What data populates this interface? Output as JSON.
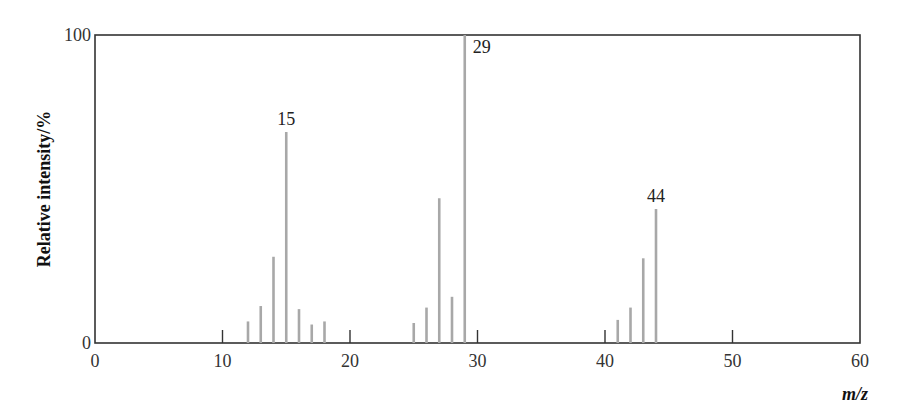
{
  "chart_data": {
    "type": "bar",
    "subtype": "mass-spectrum stick plot",
    "title": "",
    "xlabel": "m/z",
    "ylabel": "Relative intensity/%",
    "xlim": [
      0,
      60
    ],
    "ylim": [
      0,
      100
    ],
    "x_ticks": [
      0,
      10,
      20,
      30,
      40,
      50,
      60
    ],
    "y_ticks": [
      0,
      100
    ],
    "grid": false,
    "legend": null,
    "x": [
      12,
      13,
      14,
      15,
      16,
      17,
      18,
      25,
      26,
      27,
      28,
      29,
      41,
      42,
      43,
      44
    ],
    "values": [
      7,
      12,
      28,
      68.5,
      11,
      6,
      7,
      6.5,
      11.5,
      47,
      15,
      100,
      7.5,
      11.5,
      27.5,
      43.5
    ],
    "annotations": [
      {
        "x": 15,
        "text": "15"
      },
      {
        "x": 29,
        "text": "29"
      },
      {
        "x": 44,
        "text": "44"
      }
    ],
    "colors": {
      "peaks": "#a8a8a8",
      "axes": "#333333",
      "ticks": "#333333"
    }
  }
}
